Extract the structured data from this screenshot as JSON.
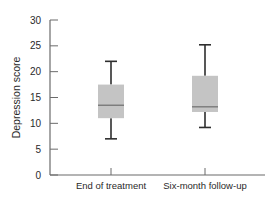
{
  "chart_data": {
    "type": "boxplot",
    "title": "",
    "xlabel": "",
    "ylabel": "Depression score",
    "ylim": [
      0,
      30
    ],
    "yticks": [
      0,
      5,
      10,
      15,
      20,
      25,
      30
    ],
    "grid": false,
    "legend": "none",
    "categories": [
      "End of treatment",
      "Six-month follow-up"
    ],
    "series": [
      {
        "name": "End of treatment",
        "min": 7,
        "q1": 11,
        "median": 13.5,
        "q3": 17.5,
        "max": 22
      },
      {
        "name": "Six-month follow-up",
        "min": 9.2,
        "q1": 12.2,
        "median": 13.2,
        "q3": 19.2,
        "max": 25.2
      }
    ],
    "colors": {
      "box_fill": "#c4c4c4",
      "median": "#7a7a7a",
      "whisker": "#2e2e2e",
      "axis": "#6b6b6b"
    }
  }
}
